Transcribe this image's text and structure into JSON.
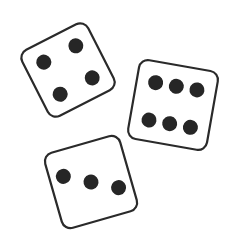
{
  "scene": {
    "description": "Three tumbling dice",
    "background": "#ffffff",
    "stroke_color": "#2a2a2a",
    "pip_color": "#262626",
    "dice": [
      {
        "name": "die-four",
        "value": 4,
        "cx": 68,
        "cy": 70,
        "rotation": -27,
        "size": 74
      },
      {
        "name": "die-six",
        "value": 6,
        "cx": 173,
        "cy": 105,
        "rotation": 10,
        "size": 80
      },
      {
        "name": "die-three",
        "value": 3,
        "cx": 91,
        "cy": 182,
        "rotation": -16,
        "size": 78
      }
    ]
  }
}
